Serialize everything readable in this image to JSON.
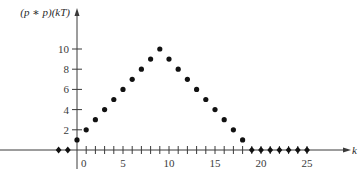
{
  "chart_data": {
    "type": "scatter",
    "title": "",
    "xlabel": "k",
    "ylabel": "(p ∗ p)(kT)",
    "x": [
      -2,
      -1,
      0,
      1,
      2,
      3,
      4,
      5,
      6,
      7,
      8,
      9,
      10,
      11,
      12,
      13,
      14,
      15,
      16,
      17,
      18,
      19,
      20,
      21,
      22,
      23,
      24,
      25
    ],
    "y": [
      0,
      0,
      1,
      2,
      3,
      4,
      5,
      6,
      7,
      8,
      9,
      10,
      9,
      8,
      7,
      6,
      5,
      4,
      3,
      2,
      1,
      0,
      0,
      0,
      0,
      0,
      0,
      0
    ],
    "series": [
      {
        "name": "(p ∗ p)(kT)",
        "marker_nonzero": "circle",
        "marker_zero": "diamond"
      }
    ],
    "xticks": [
      0,
      5,
      10,
      15,
      20,
      25
    ],
    "xtick_minor_step": 1,
    "yticks": [
      2,
      4,
      6,
      8,
      10
    ],
    "xlim": [
      -8.4,
      29.5
    ],
    "ylim": [
      0,
      14
    ],
    "grid": false,
    "legend": null
  },
  "axes": {
    "x_label": "k",
    "y_label": "(p ∗ p)(kT)",
    "x_tick_labels": [
      "0",
      "5",
      "10",
      "15",
      "20",
      "25"
    ],
    "y_tick_labels": [
      "2",
      "4",
      "6",
      "8",
      "10"
    ]
  },
  "style": {
    "axis_color": "#3a3a3a",
    "point_color": "#111111",
    "background": "#ffffff"
  }
}
